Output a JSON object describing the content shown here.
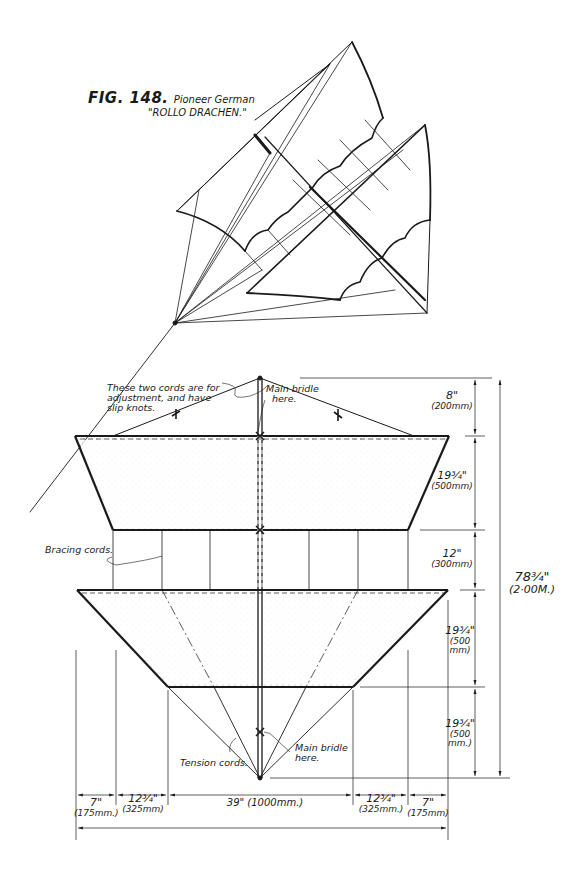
{
  "figure": {
    "number": "FIG. 148.",
    "subtitle_line1": "Pioneer German",
    "subtitle_line2": "\"ROLLO DRACHEN.\""
  },
  "annotations": {
    "adjustment_cords": [
      "These two cords are for",
      "adjustment, and have",
      "slip knots."
    ],
    "main_bridle_top": [
      "Main bridle",
      "here."
    ],
    "bracing_cords": "Bracing cords.",
    "tension_cords": "Tension cords.",
    "main_bridle_bottom": [
      "Main bridle",
      "here."
    ]
  },
  "dimensions": {
    "vertical": [
      {
        "in": "8\"",
        "mm": "(200mm)"
      },
      {
        "in": "19¾\"",
        "mm": "(500mm)"
      },
      {
        "in": "12\"",
        "mm": "(300mm)"
      },
      {
        "in": "19¾\"",
        "mm": "(500 mm)"
      },
      {
        "in": "19¾\"",
        "mm": "(500 mm.)"
      }
    ],
    "total_height": {
      "in": "78¾\"",
      "mm": "(2·00M.)"
    },
    "horizontal": [
      {
        "in": "7\"",
        "mm": "(175mm.)"
      },
      {
        "in": "12¾\"",
        "mm": "(325mm)"
      },
      {
        "in": "39\"",
        "mm": "(1000mm.)"
      },
      {
        "in": "12¾\"",
        "mm": "(325mm.)"
      },
      {
        "in": "7\"",
        "mm": "(175mm)"
      }
    ]
  },
  "colors": {
    "ink": "#1a1a1a",
    "background": "#ffffff",
    "stipple": "#9a9a9a"
  }
}
